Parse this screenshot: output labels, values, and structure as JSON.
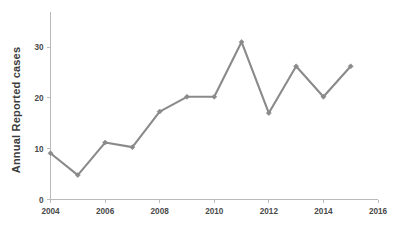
{
  "chart_data": {
    "type": "line",
    "title": "",
    "xlabel": "",
    "ylabel": "Annual Reported cases",
    "x": [
      2004,
      2005,
      2006,
      2007,
      2008,
      2009,
      2010,
      2011,
      2012,
      2013,
      2014,
      2015
    ],
    "values": [
      9.1,
      4.8,
      11.2,
      10.3,
      17.3,
      20.2,
      20.2,
      31.0,
      17.0,
      26.2,
      20.2,
      26.2
    ],
    "series": [
      {
        "name": "Annual Reported cases",
        "values": [
          9.1,
          4.8,
          11.2,
          10.3,
          17.3,
          20.2,
          20.2,
          31.0,
          17.0,
          26.2,
          20.2,
          26.2
        ]
      }
    ],
    "xlim": [
      2004,
      2016
    ],
    "ylim": [
      0,
      35
    ],
    "xticks": [
      2004,
      2006,
      2008,
      2010,
      2012,
      2014,
      2016
    ],
    "xticklabels": [
      "2004",
      "2006",
      "2008",
      "2010",
      "2012",
      "2014",
      "2016"
    ],
    "yticks": [
      0,
      10,
      20,
      30
    ],
    "yticklabels": [
      "0",
      "10",
      "20",
      "30"
    ],
    "grid": false,
    "legend": false,
    "legend_position": "none",
    "marker": "diamond",
    "colors": {
      "line": "#8a8a8a",
      "marker": "#8a8a8a",
      "axis": "#b9b9b9",
      "tick_label": "#4a4a4a",
      "axis_label": "#3c3c3c",
      "background": "#ffffff"
    }
  }
}
